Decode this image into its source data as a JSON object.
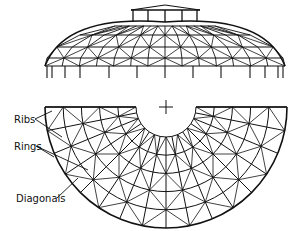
{
  "figure": {
    "type": "geodesic dome diagram",
    "views": [
      "elevation",
      "half-plan"
    ],
    "labels": [
      {
        "id": "ribs",
        "text": "Ribs"
      },
      {
        "id": "rings",
        "text": "Rings"
      },
      {
        "id": "diagonals",
        "text": "Diagonals"
      }
    ],
    "colors": {
      "line": "#111111",
      "background": "#ffffff"
    }
  }
}
